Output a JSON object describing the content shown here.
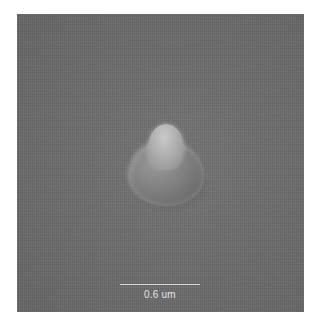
{
  "image": {
    "description": "SEM micrograph of a single bulb-shaped nanostructure on a flat gray substrate",
    "background_color": "#6d6d6d"
  },
  "scale_bar": {
    "label": "0.6 um",
    "color": "#d8d8d8"
  }
}
